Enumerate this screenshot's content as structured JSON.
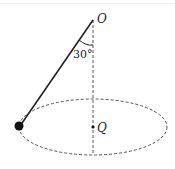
{
  "diagram": {
    "type": "conical-pendulum",
    "labels": {
      "pivot": "O",
      "center": "Q",
      "angle": "30°"
    },
    "colors": {
      "line": "#222222",
      "dashed": "#555555",
      "bob": "#111111"
    }
  }
}
